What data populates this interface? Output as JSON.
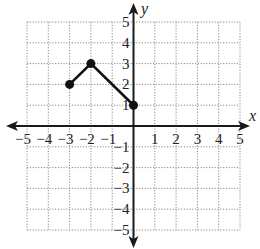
{
  "chart_data": {
    "type": "line",
    "title": "",
    "xlabel": "x",
    "ylabel": "y",
    "xlim": [
      -5,
      5
    ],
    "ylim": [
      -5,
      5
    ],
    "grid": true,
    "grid_style": "dotted",
    "x_ticks": [
      -5,
      -4,
      -3,
      -2,
      -1,
      1,
      2,
      3,
      4,
      5
    ],
    "y_ticks": [
      5,
      4,
      3,
      2,
      1,
      -1,
      -2,
      -3,
      -4,
      -5
    ],
    "x_tick_labels": [
      "−5",
      "−4",
      "−3",
      "−2",
      "−1",
      "1",
      "2",
      "3",
      "4",
      "5"
    ],
    "y_tick_labels": [
      "5",
      "4",
      "3",
      "2",
      "1",
      "−1",
      "−2",
      "−3",
      "−4",
      "−5"
    ],
    "series": [
      {
        "name": "piecewise",
        "points": [
          [
            -3,
            2
          ],
          [
            -2,
            3
          ],
          [
            0,
            1
          ]
        ],
        "x": [
          -3,
          -2,
          0
        ],
        "y": [
          2,
          3,
          1
        ],
        "endpoints": "closed"
      }
    ],
    "legend": null
  },
  "colors": {
    "axis": "#1a1a1a",
    "grid": "#8a8a8a",
    "line": "#111111",
    "background": "#ffffff"
  }
}
